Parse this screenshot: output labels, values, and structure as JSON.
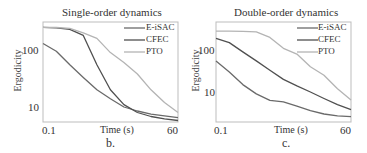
{
  "colors": {
    "E-iSAC": "#6a6a6a",
    "CFEC": "#505050",
    "PTO": "#b4b4b4",
    "frame": "#bdbdbd"
  },
  "chart_data": [
    {
      "type": "line",
      "panel": "b.",
      "title": "Single-order dynamics",
      "xlabel": "Time (s)",
      "ylabel": "Ergodicity",
      "xticks": [
        "0.1",
        "60"
      ],
      "yticks": [
        "10",
        "100"
      ],
      "yscale": "log",
      "xlim": [
        0.1,
        60
      ],
      "ylim": [
        5.5,
        310
      ],
      "legend": [
        "E-iSAC",
        "CFEC",
        "PTO"
      ],
      "legend_position": "upper right",
      "x": [
        0.1,
        6,
        12,
        18,
        24,
        30,
        36,
        42,
        48,
        54,
        60
      ],
      "series": [
        {
          "name": "E-iSAC",
          "values": [
            130,
            95,
            55,
            33,
            20,
            14,
            10,
            8.5,
            7.5,
            7,
            6.5
          ]
        },
        {
          "name": "CFEC",
          "values": [
            250,
            245,
            230,
            180,
            55,
            20,
            11,
            8,
            6.8,
            6.2,
            5.8
          ]
        },
        {
          "name": "PTO",
          "values": [
            250,
            248,
            240,
            200,
            160,
            90,
            60,
            38,
            20,
            12,
            8
          ]
        }
      ]
    },
    {
      "type": "line",
      "panel": "c.",
      "title": "Double-order dynamics",
      "xlabel": "Time (s)",
      "ylabel": "Ergodicity",
      "xticks": [
        "0.1",
        "60"
      ],
      "yticks": [
        "10",
        "100"
      ],
      "yscale": "log",
      "xlim": [
        0.1,
        60
      ],
      "ylim": [
        2.5,
        300
      ],
      "legend": [
        "E-iSAC",
        "CFEC",
        "PTO"
      ],
      "legend_position": "upper right",
      "x": [
        0.1,
        6,
        12,
        18,
        24,
        30,
        36,
        42,
        48,
        54,
        60
      ],
      "series": [
        {
          "name": "E-iSAC",
          "values": [
            55,
            30,
            15,
            9,
            6.3,
            5.8,
            4.6,
            3.6,
            3.0,
            2.7,
            2.6
          ]
        },
        {
          "name": "CFEC",
          "values": [
            190,
            150,
            90,
            55,
            33,
            20,
            14,
            10,
            7,
            5,
            3.8
          ]
        },
        {
          "name": "PTO",
          "values": [
            280,
            280,
            278,
            270,
            200,
            110,
            80,
            40,
            25,
            12,
            6.5
          ]
        }
      ]
    }
  ]
}
